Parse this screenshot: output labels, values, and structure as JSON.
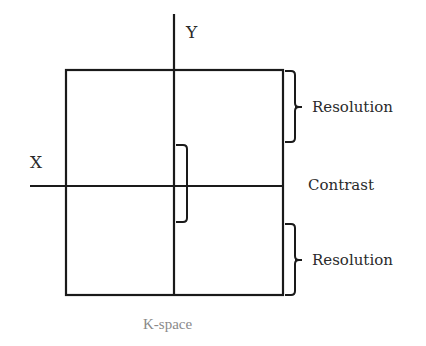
{
  "diagram": {
    "caption": "K-space",
    "axes": {
      "x_label": "X",
      "y_label": "Y"
    },
    "annotations": {
      "top": "Resolution",
      "center": "Contrast",
      "bottom": "Resolution"
    },
    "colors": {
      "lines": "#1a1a1a",
      "text": "#2a2a2a",
      "caption": "#8a8a8a",
      "background": "#ffffff"
    }
  }
}
